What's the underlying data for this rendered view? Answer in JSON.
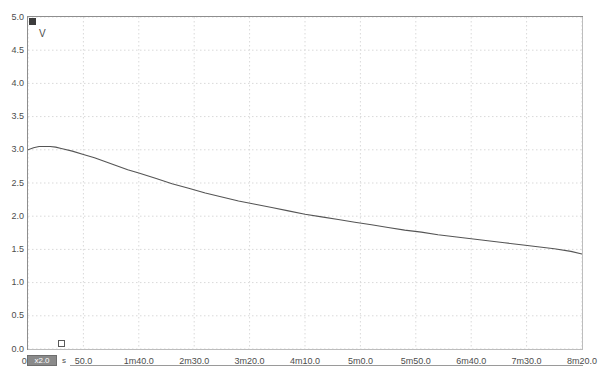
{
  "window": {
    "background_color": "#ffffff",
    "frame_color": "#8e8e8e"
  },
  "axes": {
    "y_unit": "V",
    "x_unit": "s",
    "y_ticks": [
      "5.0",
      "4.5",
      "4.0",
      "3.5",
      "3.0",
      "2.5",
      "2.0",
      "1.5",
      "1.0",
      "0.5",
      "0.0"
    ],
    "x_ticks": [
      "0.0",
      "50.0",
      "1m40.0",
      "2m30.0",
      "3m20.0",
      "4m10.0",
      "5m0.0",
      "5m50.0",
      "6m40.0",
      "7m30.0",
      "8m20.0"
    ]
  },
  "controls": {
    "zoom_badge_label": "x2.0",
    "corner_marker": "channel-marker",
    "origin_handle": "cursor-handle"
  },
  "chart_data": {
    "type": "line",
    "title": "",
    "xlabel": "",
    "ylabel": "V",
    "xlim": [
      0,
      500
    ],
    "ylim": [
      0,
      5.0
    ],
    "grid": true,
    "grid_style": "dotted",
    "grid_color": "#d9d9d9",
    "legend": "none",
    "x_tick_values": [
      0,
      50,
      100,
      150,
      200,
      250,
      300,
      350,
      400,
      450,
      500
    ],
    "x_tick_labels": [
      "0.0",
      "50.0",
      "1m40.0",
      "2m30.0",
      "3m20.0",
      "4m10.0",
      "5m0.0",
      "5m50.0",
      "6m40.0",
      "7m30.0",
      "8m20.0"
    ],
    "y_tick_values": [
      0.0,
      0.5,
      1.0,
      1.5,
      2.0,
      2.5,
      3.0,
      3.5,
      4.0,
      4.5,
      5.0
    ],
    "y_tick_labels": [
      "0.0",
      "0.5",
      "1.0",
      "1.5",
      "2.0",
      "2.5",
      "3.0",
      "3.5",
      "4.0",
      "4.5",
      "5.0"
    ],
    "series": [
      {
        "name": "voltage",
        "color": "#555555",
        "x": [
          0,
          5,
          10,
          15,
          20,
          25,
          30,
          40,
          50,
          60,
          70,
          80,
          90,
          100,
          115,
          130,
          145,
          160,
          175,
          190,
          205,
          220,
          235,
          250,
          265,
          280,
          295,
          310,
          325,
          340,
          355,
          370,
          385,
          400,
          415,
          430,
          445,
          460,
          475,
          490,
          500
        ],
        "y": [
          3.0,
          3.03,
          3.05,
          3.05,
          3.05,
          3.04,
          3.02,
          2.98,
          2.93,
          2.88,
          2.82,
          2.76,
          2.7,
          2.65,
          2.57,
          2.49,
          2.42,
          2.35,
          2.29,
          2.23,
          2.18,
          2.13,
          2.08,
          2.03,
          1.99,
          1.95,
          1.91,
          1.87,
          1.83,
          1.79,
          1.76,
          1.72,
          1.69,
          1.66,
          1.63,
          1.6,
          1.57,
          1.54,
          1.51,
          1.47,
          1.43
        ]
      }
    ]
  }
}
